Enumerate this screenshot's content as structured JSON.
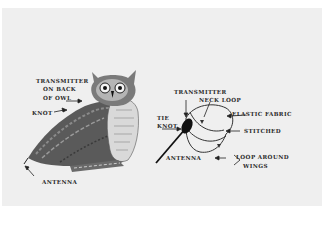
{
  "diagram": {
    "left_figure": {
      "subject": "owl-with-transmitter",
      "labels": {
        "transmitter_line1": "TRANSMITTER",
        "transmitter_line2": "ON BACK",
        "transmitter_line3": "OF OWL",
        "knot": "KNOT",
        "antenna": "ANTENNA"
      }
    },
    "right_figure": {
      "subject": "harness-detail",
      "labels": {
        "transmitter": "TRANSMITTER",
        "neck_loop": "NECK LOOP",
        "elastic_fabric": "ELASTIC FABRIC",
        "tie_knot_line1": "TIE",
        "tie_knot_line2": "KNOT",
        "stitched": "STITCHED",
        "antenna": "ANTENNA",
        "loop_around_wings_line1": "LOOP AROUND",
        "loop_around_wings_line2": "WINGS"
      }
    },
    "colors": {
      "background": "#efefef",
      "ink": "#2a2a2a",
      "transmitter": "#111111"
    }
  }
}
